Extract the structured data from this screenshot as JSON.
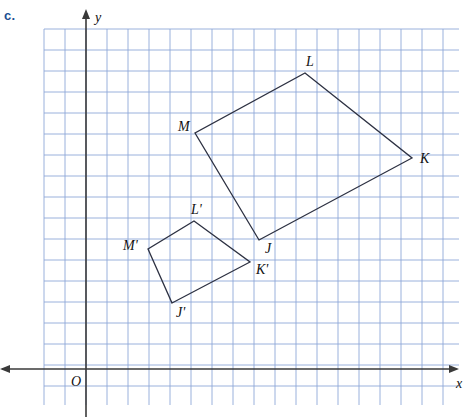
{
  "part": {
    "label": "c."
  },
  "axes": {
    "y_label": "y",
    "x_label": "x",
    "origin_label": "O",
    "origin_px": [
      86,
      369
    ],
    "color": "#3a3a3a"
  },
  "grid": {
    "color": "#8fa8d8",
    "spacing_px": 21,
    "left_px": 44,
    "top_px": 29,
    "right_px": 459,
    "bottom_px": 405
  },
  "chart_data": {
    "type": "diagram",
    "title": "",
    "xlabel": "x",
    "ylabel": "y",
    "grid": true,
    "legend": "none",
    "note": "Quadrilateral JKLM and its dilation image J'K'L'M' on a coordinate grid",
    "origin_px": [
      86,
      369
    ],
    "unit_px": 21,
    "series": [
      {
        "name": "JKLM",
        "closed": true,
        "stroke": "#2d3142",
        "points_px": [
          [
            259,
            240
          ],
          [
            412,
            158
          ],
          [
            305,
            73
          ],
          [
            195,
            133
          ]
        ],
        "vertices": [
          {
            "name": "J",
            "px": [
              259,
              240
            ],
            "grid": [
              8.2,
              6.1
            ],
            "label_dx": 6,
            "label_dy": 13
          },
          {
            "name": "K",
            "px": [
              412,
              158
            ],
            "grid": [
              15.5,
              10.0
            ],
            "label_dx": 8,
            "label_dy": 5
          },
          {
            "name": "L",
            "px": [
              305,
              73
            ],
            "grid": [
              10.4,
              14.1
            ],
            "label_dx": 1,
            "label_dy": -7
          },
          {
            "name": "M",
            "px": [
              195,
              133
            ],
            "grid": [
              5.2,
              11.2
            ],
            "label_dx": -17,
            "label_dy": -2
          }
        ]
      },
      {
        "name": "J'K'L'M'",
        "closed": true,
        "stroke": "#2d3142",
        "points_px": [
          [
            172,
            303
          ],
          [
            250,
            262
          ],
          [
            194,
            221
          ],
          [
            148,
            249
          ]
        ],
        "vertices": [
          {
            "name": "J'",
            "px": [
              172,
              303
            ],
            "grid": [
              4.1,
              3.1
            ],
            "label_dx": 4,
            "label_dy": 14
          },
          {
            "name": "K'",
            "px": [
              250,
              262
            ],
            "grid": [
              7.8,
              5.1
            ],
            "label_dx": 6,
            "label_dy": 12
          },
          {
            "name": "L'",
            "px": [
              194,
              221
            ],
            "grid": [
              5.1,
              7.0
            ],
            "label_dx": -3,
            "label_dy": -7
          },
          {
            "name": "M'",
            "px": [
              148,
              249
            ],
            "grid": [
              3.0,
              5.7
            ],
            "label_dx": -25,
            "label_dy": 1
          }
        ]
      }
    ]
  }
}
